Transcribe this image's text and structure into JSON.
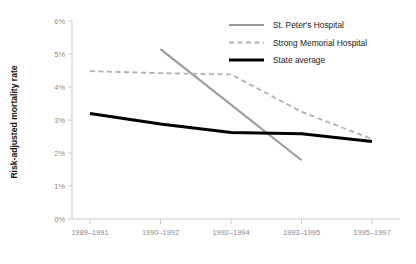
{
  "chart_data": {
    "type": "line",
    "title": "",
    "xlabel": "",
    "ylabel": "Risk-adjusted mortality rate",
    "categories": [
      "1989–1991",
      "1990–1992",
      "1992–1994",
      "1993–1995",
      "1995–1997"
    ],
    "ylim": [
      0,
      6
    ],
    "ytick_labels": [
      "0%",
      "1%",
      "2%",
      "3%",
      "4%",
      "5%",
      "6%"
    ],
    "ytick_values": [
      0,
      1,
      2,
      3,
      4,
      5,
      6
    ],
    "grid": false,
    "legend_position": "top-right",
    "series": [
      {
        "name": "St. Peter's Hospital",
        "style": "solid",
        "color": "#9b9b9b",
        "width": 2.2,
        "x": [
          "1990–1992",
          "1993–1995"
        ],
        "values": [
          5.15,
          1.78
        ]
      },
      {
        "name": "Strong Memorial Hospital",
        "style": "dashed",
        "color": "#b0b0b0",
        "width": 1.8,
        "x": [
          "1989–1991",
          "1990–1992",
          "1992–1994",
          "1993–1995",
          "1995–1997"
        ],
        "values": [
          4.48,
          4.42,
          4.38,
          3.25,
          2.42
        ]
      },
      {
        "name": "State average",
        "style": "solid",
        "color": "#000000",
        "width": 3.0,
        "x": [
          "1989–1991",
          "1990–1992",
          "1992–1994",
          "1993–1995",
          "1995–1997"
        ],
        "values": [
          3.2,
          2.88,
          2.62,
          2.58,
          2.35
        ]
      }
    ]
  },
  "axis": {
    "line_color": "#c9c9c9",
    "tick_color": "#c9c9c9",
    "label_color": "#8a8a8a"
  },
  "legend": {
    "items": [
      {
        "label": "St. Peter's Hospital",
        "swatch": "solid-gray-line-icon"
      },
      {
        "label": "Strong Memorial Hospital",
        "swatch": "dashed-gray-line-icon"
      },
      {
        "label": "State average",
        "swatch": "solid-black-line-icon"
      }
    ]
  }
}
